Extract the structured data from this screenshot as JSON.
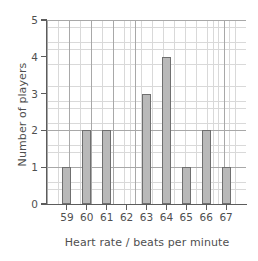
{
  "chart_data": {
    "type": "bar",
    "title": "",
    "xlabel": "Heart rate / beats per minute",
    "ylabel": "Number of players",
    "categories": [
      "59",
      "60",
      "61",
      "62",
      "63",
      "64",
      "65",
      "66",
      "67"
    ],
    "values": [
      1,
      2,
      2,
      0,
      3,
      4,
      1,
      2,
      1
    ],
    "xtick_labels": [
      "59",
      "60",
      "61",
      "62",
      "63",
      "64",
      "65",
      "66",
      "67"
    ],
    "ytick_labels": [
      "0",
      "1",
      "2",
      "3",
      "4",
      "5"
    ],
    "ytick_values": [
      0,
      1,
      2,
      3,
      4,
      5
    ],
    "ylim": [
      0,
      5
    ],
    "grid": "major-and-minor",
    "legend": "none",
    "bar_fill_color": "#b9b9b9",
    "bar_border_color": "#6f6f6f",
    "grid_minor_color": "#d9d9d9",
    "grid_major_color": "#a8a8a8",
    "axis_color": "#5c5c5c",
    "background_color": "#ffffff",
    "text_color": "#4f4f4f"
  }
}
